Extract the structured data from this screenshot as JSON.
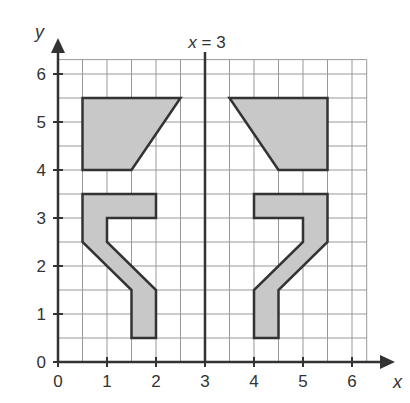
{
  "figure": {
    "mirror_line_label": "x = 3",
    "x_axis_label": "x",
    "y_axis_label": "y",
    "x_ticks": [
      "0",
      "1",
      "2",
      "3",
      "4",
      "5",
      "6"
    ],
    "y_ticks": [
      "0",
      "1",
      "2",
      "3",
      "4",
      "5",
      "6"
    ],
    "grid": {
      "step": 0.5,
      "x_range": [
        0,
        6.3
      ],
      "y_range": [
        0,
        6.3
      ]
    },
    "colors": {
      "shape_fill": "#c8c8c8",
      "outline": "#333333",
      "grid": "#999999"
    },
    "shapes": [
      {
        "name": "left-trapezoid",
        "points": [
          [
            0.5,
            5.5
          ],
          [
            2.5,
            5.5
          ],
          [
            1.5,
            4
          ],
          [
            0.5,
            4
          ]
        ]
      },
      {
        "name": "right-trapezoid",
        "points": [
          [
            3.5,
            5.5
          ],
          [
            5.5,
            5.5
          ],
          [
            5.5,
            4
          ],
          [
            4.5,
            4
          ]
        ]
      },
      {
        "name": "left-seven-shape",
        "points": [
          [
            0.5,
            3.5
          ],
          [
            2,
            3.5
          ],
          [
            2,
            3
          ],
          [
            1,
            3
          ],
          [
            1,
            2.5
          ],
          [
            2,
            1.5
          ],
          [
            2,
            0.5
          ],
          [
            1.5,
            0.5
          ],
          [
            1.5,
            1.5
          ],
          [
            0.5,
            2.5
          ]
        ]
      },
      {
        "name": "right-seven-shape",
        "points": [
          [
            4,
            3.5
          ],
          [
            5.5,
            3.5
          ],
          [
            5.5,
            2.5
          ],
          [
            4.5,
            1.5
          ],
          [
            4.5,
            0.5
          ],
          [
            4,
            0.5
          ],
          [
            4,
            1.5
          ],
          [
            5,
            2.5
          ],
          [
            5,
            3
          ],
          [
            4,
            3
          ]
        ]
      }
    ]
  }
}
